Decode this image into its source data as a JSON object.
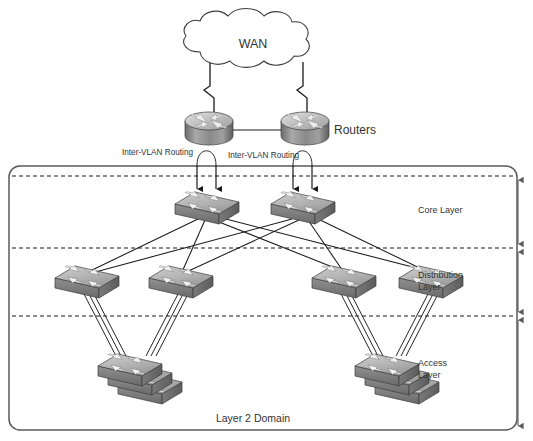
{
  "diagram": {
    "cloud": {
      "label": "WAN"
    },
    "routers": {
      "label": "Routers",
      "count": 2
    },
    "annotations": {
      "intervlan_left": "Inter-VLAN Routing",
      "intervlan_right": "Inter-VLAN Routing"
    },
    "layers": [
      {
        "id": "core",
        "label": "Core Layer",
        "line1": "Core Layer",
        "line2": ""
      },
      {
        "id": "distribution",
        "label": "Distribution Layer",
        "line1": "Distribution",
        "line2": "Layer"
      },
      {
        "id": "access",
        "label": "Access Layer",
        "line1": "Access",
        "line2": "Layer"
      }
    ],
    "domain": {
      "label": "Layer 2 Domain"
    },
    "colors": {
      "background": "#ffffff",
      "stroke": "#1a1a1a",
      "text": "#333333",
      "device_top": "#d6d6d6",
      "device_front": "#8c8c8c",
      "device_side": "#6e6e6e",
      "border": "#4d4d4d",
      "dashed": "#1a1a1a"
    },
    "device_counts": {
      "core_switches": 2,
      "distribution_switches": 4,
      "access_stacks": 2,
      "switches_per_stack": 3
    }
  }
}
